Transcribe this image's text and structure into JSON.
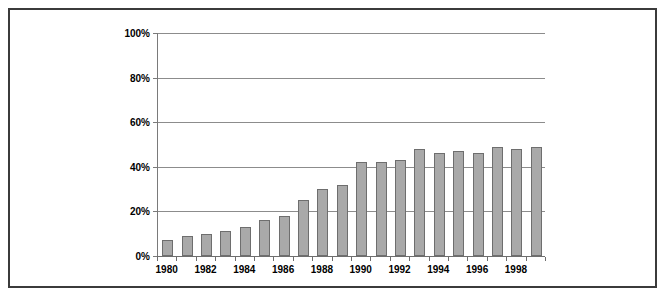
{
  "chart_data": {
    "type": "bar",
    "title": "",
    "subtitle": "",
    "xlabel": "",
    "ylabel": "",
    "categories": [
      "1980",
      "1981",
      "1982",
      "1983",
      "1984",
      "1985",
      "1986",
      "1987",
      "1988",
      "1989",
      "1990",
      "1991",
      "1992",
      "1993",
      "1994",
      "1995",
      "1996",
      "1997",
      "1998",
      "1999"
    ],
    "values": [
      7,
      9,
      10,
      11,
      13,
      16,
      18,
      25,
      30,
      32,
      42,
      42,
      43,
      48,
      46,
      47,
      46,
      49,
      48,
      49
    ],
    "series": [
      {
        "name": "",
        "values": [
          7,
          9,
          10,
          11,
          13,
          16,
          18,
          25,
          30,
          32,
          42,
          42,
          43,
          48,
          46,
          47,
          46,
          49,
          48,
          49
        ]
      }
    ],
    "ylim": [
      0,
      100
    ],
    "yticks": [
      0,
      20,
      40,
      60,
      80,
      100
    ],
    "ytick_labels": [
      "0%",
      "20%",
      "40%",
      "60%",
      "80%",
      "100%"
    ],
    "xtick_labels": [
      "1980",
      "1982",
      "1984",
      "1986",
      "1988",
      "1990",
      "1992",
      "1994",
      "1996",
      "1998"
    ],
    "xtick_indices": [
      0,
      2,
      4,
      6,
      8,
      10,
      12,
      14,
      16,
      18
    ],
    "grid": true,
    "grid_axis": "y",
    "legend": false,
    "legend_position": "none",
    "annotations": [],
    "colors": {
      "bar_fill": "#a9a9a9",
      "bar_border": "#6e6e6e",
      "gridline": "#8c8c8c",
      "axis": "#6e6e6e",
      "text": "#000000",
      "frame_border": "#3b3b3b",
      "background": "#ffffff"
    }
  }
}
